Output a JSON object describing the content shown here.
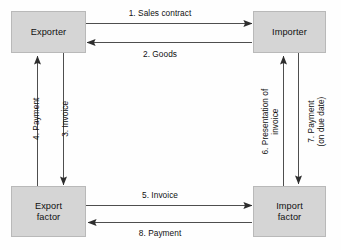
{
  "diagram": {
    "type": "flow-diagram",
    "colors": {
      "node_fill": "#d5d5d5",
      "node_border": "#b9b9b9",
      "line": "#3a3a3a",
      "text": "#101010",
      "background": "#ffffff"
    },
    "nodes": [
      {
        "id": "exporter",
        "label": "Exporter"
      },
      {
        "id": "importer",
        "label": "Importer"
      },
      {
        "id": "export-factor",
        "label": "Export\nfactor"
      },
      {
        "id": "import-factor",
        "label": "Import\nfactor"
      }
    ],
    "edges": [
      {
        "id": "edge-1",
        "step": "1",
        "label": "1. Sales contract",
        "from": "exporter",
        "to": "importer",
        "orientation": "horizontal",
        "direction": "right"
      },
      {
        "id": "edge-2",
        "step": "2",
        "label": "2. Goods",
        "from": "importer",
        "to": "exporter",
        "orientation": "horizontal",
        "direction": "left"
      },
      {
        "id": "edge-3",
        "step": "3",
        "label": "3. Invoice",
        "from": "exporter",
        "to": "export-factor",
        "orientation": "vertical",
        "direction": "down"
      },
      {
        "id": "edge-4",
        "step": "4",
        "label": "4. Payment",
        "from": "export-factor",
        "to": "exporter",
        "orientation": "vertical",
        "direction": "up"
      },
      {
        "id": "edge-5",
        "step": "5",
        "label": "5. Invoice",
        "from": "export-factor",
        "to": "import-factor",
        "orientation": "horizontal",
        "direction": "right"
      },
      {
        "id": "edge-6",
        "step": "6",
        "label": "6. Presentation of\ninvoice",
        "from": "import-factor",
        "to": "importer",
        "orientation": "vertical",
        "direction": "up"
      },
      {
        "id": "edge-7",
        "step": "7",
        "label": "7. Payment\n(on due date)",
        "from": "importer",
        "to": "import-factor",
        "orientation": "vertical",
        "direction": "down"
      },
      {
        "id": "edge-8",
        "step": "8",
        "label": "8. Payment",
        "from": "import-factor",
        "to": "export-factor",
        "orientation": "horizontal",
        "direction": "left"
      }
    ]
  }
}
